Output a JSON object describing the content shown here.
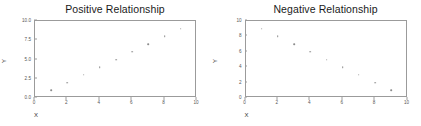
{
  "figure": {
    "background_color": "#ffffff",
    "frame_color": "#9b9b9b",
    "marker_color": "#8c8c8c",
    "tick_text_color": "#555555",
    "title_color": "#1a1a1a"
  },
  "chart_data": [
    {
      "type": "scatter",
      "title": "Positive Relationship",
      "xlabel": "X",
      "ylabel": "Y",
      "xlim": [
        0,
        10
      ],
      "ylim": [
        0,
        10
      ],
      "grid": false,
      "legend": "none",
      "xticks": [
        0,
        2,
        4,
        6,
        8,
        10
      ],
      "xtick_labels": [
        "0",
        "2",
        "4",
        "6",
        "8",
        "10"
      ],
      "yticks": [
        0,
        2.5,
        5,
        7.5,
        10
      ],
      "ytick_labels": [
        "0.0",
        "2.5",
        "5.0",
        "7.5",
        "10.0"
      ],
      "x": [
        1,
        2,
        3,
        4,
        5,
        6,
        7,
        8,
        9
      ],
      "y": [
        1,
        2,
        3,
        4,
        5,
        6,
        7,
        8,
        9
      ]
    },
    {
      "type": "scatter",
      "title": "Negative Relationship",
      "xlabel": "X",
      "ylabel": "Y",
      "xlim": [
        0,
        10
      ],
      "ylim": [
        0,
        10
      ],
      "grid": false,
      "legend": "none",
      "xticks": [
        0,
        2,
        4,
        6,
        8,
        10
      ],
      "xtick_labels": [
        "0",
        "2",
        "4",
        "6",
        "8",
        "10"
      ],
      "yticks": [
        0,
        2,
        4,
        6,
        8,
        10
      ],
      "ytick_labels": [
        "0",
        "2",
        "4",
        "6",
        "8",
        "10"
      ],
      "x": [
        1,
        2,
        3,
        4,
        5,
        6,
        7,
        8,
        9
      ],
      "y": [
        9,
        8,
        7,
        6,
        5,
        4,
        3,
        2,
        1
      ]
    }
  ]
}
